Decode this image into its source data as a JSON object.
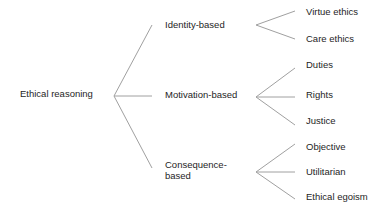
{
  "root": {
    "label": "Ethical reasoning"
  },
  "categories": [
    {
      "label": "Identity-based",
      "children": [
        "Virtue ethics",
        "Care ethics"
      ]
    },
    {
      "label": "Motivation-based",
      "children": [
        "Duties",
        "Rights",
        "Justice"
      ]
    },
    {
      "label": "Consequence-\nbased",
      "line1": "Consequence-",
      "line2": "based",
      "children": [
        "Objective",
        "Utilitarian",
        "Ethical egoism"
      ]
    }
  ],
  "colors": {
    "line": "#a0a0a0",
    "text": "#1e1e1e",
    "background": "#ffffff"
  }
}
